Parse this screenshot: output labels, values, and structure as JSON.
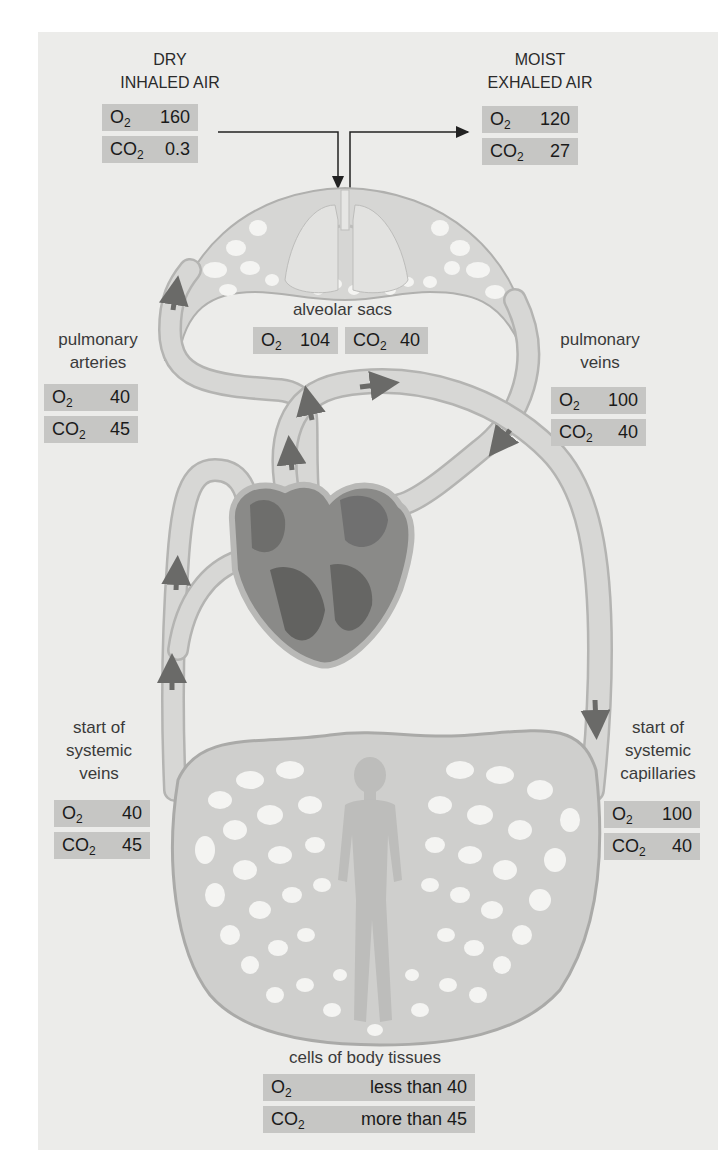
{
  "colors": {
    "panel": "#ececea",
    "value_box": "#c6c6c4",
    "vessel": "#c9c9c7",
    "vessel_edge": "#a9a9a7",
    "heart_dark": "#7a7a78",
    "arrow": "#6a6a68"
  },
  "gas_labels": {
    "o2": "O",
    "co2": "CO",
    "sub": "2"
  },
  "stations": {
    "inhaled": {
      "label_line1": "DRY",
      "label_line2": "INHALED AIR",
      "o2": "160",
      "co2": "0.3"
    },
    "exhaled": {
      "label_line1": "MOIST",
      "label_line2": "EXHALED AIR",
      "o2": "120",
      "co2": "27"
    },
    "alveolar": {
      "label": "alveolar sacs",
      "o2": "104",
      "co2": "40"
    },
    "pulmonary_arteries": {
      "label_line1": "pulmonary",
      "label_line2": "arteries",
      "o2": "40",
      "co2": "45"
    },
    "pulmonary_veins": {
      "label_line1": "pulmonary",
      "label_line2": "veins",
      "o2": "100",
      "co2": "40"
    },
    "systemic_veins": {
      "label_line1": "start of",
      "label_line2": "systemic",
      "label_line3": "veins",
      "o2": "40",
      "co2": "45"
    },
    "systemic_capillaries": {
      "label_line1": "start of",
      "label_line2": "systemic",
      "label_line3": "capillaries",
      "o2": "100",
      "co2": "40"
    },
    "body_tissues": {
      "label": "cells of body tissues",
      "o2": "less than 40",
      "co2": "more than 45"
    }
  },
  "icons": [
    "lungs-icon",
    "heart-icon",
    "human-figure-icon",
    "flow-arrow-icon"
  ]
}
